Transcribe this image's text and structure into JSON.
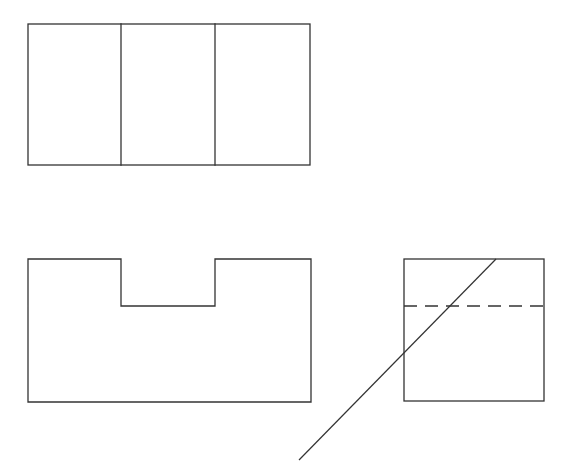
{
  "drawing": {
    "type": "orthographic-three-view",
    "stroke_color": "#333333",
    "background": "#ffffff",
    "views": {
      "top_view": {
        "outline": {
          "x": 28,
          "y": 24,
          "width": 282,
          "height": 141
        },
        "dividers_x": [
          121,
          215
        ]
      },
      "front_view": {
        "outline_points": "28,259 121,259 121,306 215,306 215,259 311,259 311,402 28,402"
      },
      "side_view": {
        "outline": {
          "x": 404,
          "y": 259,
          "width": 140,
          "height": 142
        },
        "hidden_line": {
          "x1": 404,
          "y1": 306,
          "x2": 544,
          "y2": 306
        }
      },
      "miter_line": {
        "x1": 299,
        "y1": 460,
        "x2": 496,
        "y2": 259
      }
    }
  }
}
